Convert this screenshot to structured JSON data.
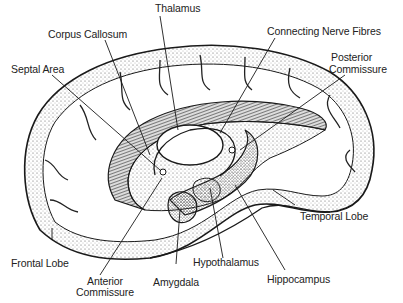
{
  "diagram": {
    "colors": {
      "ink": "#1a1a1a",
      "stipple": "#9a9a9a",
      "background": "#ffffff",
      "hatch": "#444444"
    },
    "labels": {
      "thalamus": "Thalamus",
      "corpus_callosum": "Corpus Callosum",
      "connecting_nerve_fibres": "Connecting Nerve Fibres",
      "septal_area": "Septal Area",
      "posterior_commissure_1": "Posterior",
      "posterior_commissure_2": "Commissure",
      "temporal_lobe": "Temporal Lobe",
      "frontal_lobe": "Frontal Lobe",
      "anterior_commissure_1": "Anterior",
      "anterior_commissure_2": "Commissure",
      "amygdala": "Amygdala",
      "hypothalamus": "Hypothalamus",
      "hippocampus": "Hippocampus"
    }
  }
}
